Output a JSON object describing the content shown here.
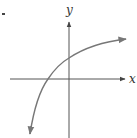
{
  "diagram": {
    "type": "function-graph",
    "x_axis_label": "x",
    "y_axis_label": "y",
    "curve_description": "increasing concave-down curve (logarithmic shape) with arrows at both ends",
    "colors": {
      "axes": "#555555",
      "curve": "#777777",
      "labels": "#333333",
      "bullet": "#444444"
    }
  }
}
